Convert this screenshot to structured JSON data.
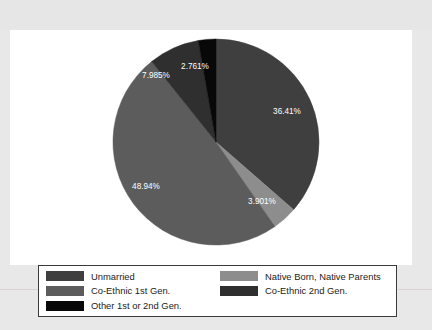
{
  "chart_data": {
    "type": "pie",
    "title": "",
    "start_angle_deg": 0,
    "direction": "clockwise",
    "legend_position": "bottom",
    "categories": [
      "Unmarried",
      "Native Born, Native Parents",
      "Co-Ethnic 1st Gen.",
      "Co-Ethnic 2nd Gen.",
      "Other 1st or 2nd Gen."
    ],
    "values": [
      36.41,
      3.901,
      48.94,
      7.985,
      2.761
    ],
    "value_labels": [
      "36.41%",
      "3.901%",
      "48.94%",
      "7.985%",
      "2.761%"
    ],
    "colors": [
      "#3f3f3f",
      "#8d8d8d",
      "#5c5c5c",
      "#2f2f2f",
      "#080808"
    ],
    "slices": [
      {
        "label": "Unmarried",
        "value": 36.41,
        "value_label": "36.41%",
        "color": "#3f3f3f",
        "label_x": 277,
        "label_y": 84,
        "label_color": "light"
      },
      {
        "label": "Native Born, Native Parents",
        "value": 3.901,
        "value_label": "3.901%",
        "color": "#8d8d8d",
        "label_x": 252,
        "label_y": 174,
        "label_color": "light"
      },
      {
        "label": "Co-Ethnic 1st Gen.",
        "value": 48.94,
        "value_label": "48.94%",
        "color": "#5c5c5c",
        "label_x": 136,
        "label_y": 159,
        "label_color": "light"
      },
      {
        "label": "Co-Ethnic 2nd Gen.",
        "value": 7.985,
        "value_label": "7.985%",
        "color": "#2f2f2f",
        "label_x": 146,
        "label_y": 48,
        "label_color": "light"
      },
      {
        "label": "Other 1st or 2nd Gen.",
        "value": 2.761,
        "value_label": "2.761%",
        "color": "#080808",
        "label_x": 185,
        "label_y": 39,
        "label_color": "light"
      }
    ],
    "geometry": {
      "center_x": 206,
      "center_y": 112,
      "radius": 103
    }
  },
  "legend": {
    "entries": [
      {
        "label": "Unmarried",
        "color": "#3f3f3f"
      },
      {
        "label": "Native Born, Native Parents",
        "color": "#8d8d8d"
      },
      {
        "label": "Co-Ethnic 1st Gen.",
        "color": "#5c5c5c"
      },
      {
        "label": "Co-Ethnic 2nd Gen.",
        "color": "#2f2f2f"
      },
      {
        "label": "Other 1st or 2nd Gen.",
        "color": "#080808"
      }
    ]
  }
}
